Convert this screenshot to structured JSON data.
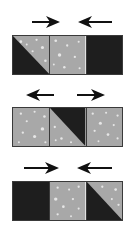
{
  "colors": {
    "dark": "#1e1e1e",
    "light": "#a8a8a8",
    "dots": "#e6e6e6",
    "arrow": "#111111"
  },
  "rows": [
    {
      "arrows": "inward",
      "squares": [
        "hst-dark-bottom-left",
        "light",
        "dark"
      ]
    },
    {
      "arrows": "outward",
      "squares": [
        "light",
        "hst-dark-top-right",
        "light"
      ]
    },
    {
      "arrows": "inward",
      "squares": [
        "dark",
        "light",
        "hst-dark-bottom-left"
      ]
    }
  ]
}
